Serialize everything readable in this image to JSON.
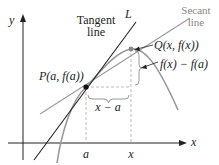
{
  "labels": {
    "y_axis": "y",
    "x_axis": "x",
    "tangent_line": [
      "Tangent",
      "line"
    ],
    "line_L": "L",
    "secant_line": [
      "Secant",
      "line"
    ],
    "point_P": "P(a, f(a))",
    "point_Q": "Q(x,  f(x))",
    "rise": "f(x) − f(a)",
    "run": "x − a",
    "tick_a": "a",
    "tick_x": "x"
  },
  "colors": {
    "axis": "#222222",
    "tangent": "#222222",
    "curve": "#999999",
    "secant": "#999999",
    "guide": "#aaaaaa",
    "label_gray": "#888888",
    "text": "#222222"
  }
}
